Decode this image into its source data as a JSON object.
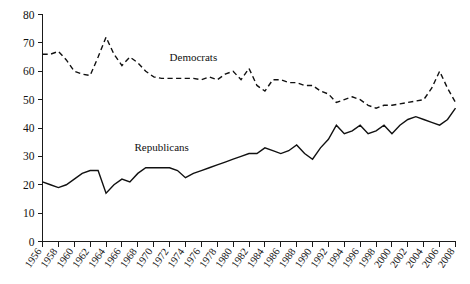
{
  "chart_data": {
    "type": "line",
    "title": "",
    "subtitle": "",
    "xlabel": "",
    "ylabel": "",
    "grid": false,
    "legend_position": "inline-annotation",
    "xlim": [
      1956,
      2008
    ],
    "ylim": [
      0,
      80
    ],
    "yticks": [
      0,
      10,
      20,
      30,
      40,
      50,
      60,
      70,
      80
    ],
    "ytick_labels": [
      "0",
      "10",
      "20",
      "30",
      "40",
      "50",
      "60",
      "70",
      "80"
    ],
    "x": [
      1956,
      1957,
      1958,
      1959,
      1960,
      1961,
      1962,
      1963,
      1964,
      1965,
      1966,
      1967,
      1968,
      1969,
      1970,
      1971,
      1972,
      1973,
      1974,
      1975,
      1976,
      1977,
      1978,
      1979,
      1980,
      1981,
      1982,
      1983,
      1984,
      1985,
      1986,
      1987,
      1988,
      1989,
      1990,
      1991,
      1992,
      1993,
      1994,
      1995,
      1996,
      1997,
      1998,
      1999,
      2000,
      2001,
      2002,
      2003,
      2004,
      2005,
      2006,
      2007,
      2008
    ],
    "xticks": [
      1956,
      1958,
      1960,
      1962,
      1964,
      1966,
      1968,
      1970,
      1972,
      1974,
      1976,
      1978,
      1980,
      1982,
      1984,
      1986,
      1988,
      1990,
      1992,
      1994,
      1996,
      1998,
      2000,
      2002,
      2004,
      2006,
      2008
    ],
    "xtick_labels": [
      "1956",
      "1958",
      "1960",
      "1962",
      "1964",
      "1966",
      "1968",
      "1970",
      "1972",
      "1974",
      "1976",
      "1978",
      "1980",
      "1982",
      "1984",
      "1986",
      "1988",
      "1990",
      "1992",
      "1994",
      "1996",
      "1998",
      "2000",
      "2002",
      "2004",
      "2006",
      "2008"
    ],
    "series": [
      {
        "name": "Democrats",
        "style": "dashed",
        "color": "#111111",
        "label_x": 1975,
        "label_y": 63.5,
        "values": [
          66,
          66,
          67,
          64,
          60,
          59,
          58.5,
          65,
          72,
          66,
          62,
          65,
          63,
          60,
          58,
          57.5,
          57.5,
          57.5,
          57.5,
          57.5,
          57,
          58,
          57,
          59,
          60,
          57,
          61,
          55,
          53,
          57,
          57,
          56,
          56,
          55,
          55,
          53,
          52,
          49,
          50,
          51,
          50,
          48,
          47,
          48,
          48,
          48.5,
          49,
          49.5,
          50,
          54,
          60,
          54,
          49
        ]
      },
      {
        "name": "Republicans",
        "style": "solid",
        "color": "#111111",
        "label_x": 1971,
        "label_y": 32,
        "values": [
          21,
          20,
          19,
          20,
          22,
          24,
          25,
          25,
          17,
          20,
          22,
          21,
          24,
          26,
          26,
          26,
          26,
          25,
          22.5,
          24,
          25,
          26,
          27,
          28,
          29,
          30,
          31,
          31,
          33,
          32,
          31,
          32,
          34,
          31,
          29,
          33,
          36,
          41,
          38,
          39,
          41,
          38,
          39,
          41,
          38,
          41,
          43,
          44,
          43,
          42,
          41,
          43,
          47
        ]
      }
    ]
  },
  "annotations": {
    "democrats_label": "Democrats",
    "republicans_label": "Republicans"
  },
  "axes": {
    "y_axis_name": "y-axis",
    "x_axis_name": "x-axis"
  }
}
